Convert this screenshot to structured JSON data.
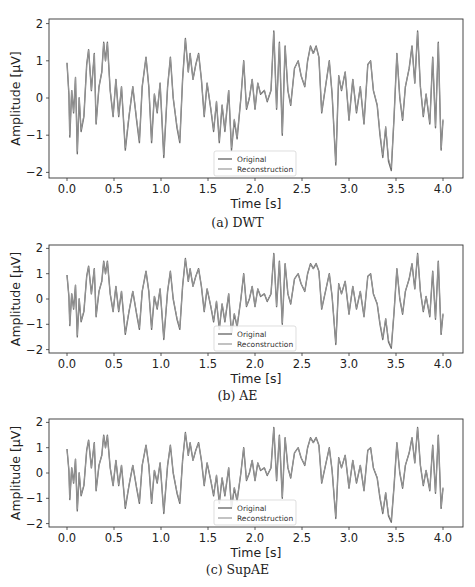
{
  "figure": {
    "panels": [
      {
        "caption": "(a) DWT",
        "ylabel": "Amplitude [µV]",
        "xlabel": "Time [s]",
        "legend": [
          "Original",
          "Reconstruction"
        ]
      },
      {
        "caption": "(b) AE",
        "ylabel": "Amplitude [µV]",
        "xlabel": "Time [s]",
        "legend": [
          "Original",
          "Reconstruction"
        ]
      },
      {
        "caption": "(c) SupAE",
        "ylabel": "Amplitude [µV]",
        "xlabel": "Time [s]",
        "legend": [
          "Original",
          "Reconstruction"
        ]
      }
    ],
    "colors": {
      "original": "#6e6e6e",
      "reconstruction": "#9a9a9a",
      "axes": "#333333"
    }
  },
  "chart_data": [
    {
      "type": "line",
      "title": "(a) DWT",
      "xlabel": "Time [s]",
      "ylabel": "Amplitude [µV]",
      "xlim": [
        -0.1,
        4.1
      ],
      "ylim": [
        -2.1,
        2.1
      ],
      "xticks": [
        "0.0",
        "0.5",
        "1.0",
        "1.5",
        "2.0",
        "2.5",
        "3.0",
        "3.5",
        "4.0"
      ],
      "yticks": [
        "2",
        "1",
        "0",
        "-1",
        "-2"
      ],
      "legend_position": "lower center",
      "grid": false,
      "series": [
        {
          "name": "Original"
        },
        {
          "name": "Reconstruction"
        }
      ]
    },
    {
      "type": "line",
      "title": "(b) AE",
      "xlabel": "Time [s]",
      "ylabel": "Amplitude [µV]",
      "xlim": [
        -0.1,
        4.1
      ],
      "ylim": [
        -2.1,
        2.1
      ],
      "xticks": [
        "0.0",
        "0.5",
        "1.0",
        "1.5",
        "2.0",
        "2.5",
        "3.0",
        "3.5",
        "4.0"
      ],
      "yticks": [
        "2",
        "1",
        "0",
        "-1",
        "-2"
      ],
      "legend_position": "lower center",
      "grid": false,
      "series": [
        {
          "name": "Original"
        },
        {
          "name": "Reconstruction"
        }
      ]
    },
    {
      "type": "line",
      "title": "(c) SupAE",
      "xlabel": "Time [s]",
      "ylabel": "Amplitude [µV]",
      "xlim": [
        -0.1,
        4.1
      ],
      "ylim": [
        -2.1,
        2.1
      ],
      "xticks": [
        "0.0",
        "0.5",
        "1.0",
        "1.5",
        "2.0",
        "2.5",
        "3.0",
        "3.5",
        "4.0"
      ],
      "yticks": [
        "2",
        "1",
        "0",
        "-1",
        "-2"
      ],
      "legend_position": "lower center",
      "grid": false,
      "series": [
        {
          "name": "Original"
        },
        {
          "name": "Reconstruction"
        }
      ]
    }
  ],
  "signal": {
    "t": [
      0.0,
      0.02,
      0.03,
      0.05,
      0.07,
      0.09,
      0.11,
      0.13,
      0.15,
      0.18,
      0.21,
      0.23,
      0.26,
      0.29,
      0.31,
      0.34,
      0.37,
      0.39,
      0.41,
      0.43,
      0.46,
      0.49,
      0.52,
      0.55,
      0.58,
      0.62,
      0.66,
      0.7,
      0.74,
      0.77,
      0.8,
      0.84,
      0.87,
      0.9,
      0.93,
      0.96,
      0.99,
      1.03,
      1.07,
      1.1,
      1.13,
      1.17,
      1.2,
      1.23,
      1.26,
      1.29,
      1.31,
      1.34,
      1.37,
      1.4,
      1.43,
      1.46,
      1.49,
      1.53,
      1.56,
      1.59,
      1.62,
      1.65,
      1.68,
      1.72,
      1.75,
      1.78,
      1.81,
      1.85,
      1.88,
      1.91,
      1.94,
      1.97,
      2.0,
      2.03,
      2.06,
      2.1,
      2.13,
      2.17,
      2.2,
      2.23,
      2.26,
      2.29,
      2.32,
      2.35,
      2.38,
      2.42,
      2.46,
      2.49,
      2.53,
      2.56,
      2.59,
      2.62,
      2.65,
      2.68,
      2.71,
      2.75,
      2.79,
      2.82,
      2.86,
      2.89,
      2.92,
      2.96,
      3.0,
      3.04,
      3.08,
      3.12,
      3.16,
      3.2,
      3.23,
      3.26,
      3.3,
      3.33,
      3.36,
      3.39,
      3.42,
      3.45,
      3.48,
      3.51,
      3.54,
      3.57,
      3.6,
      3.64,
      3.67,
      3.7,
      3.73,
      3.76,
      3.79,
      3.82,
      3.86,
      3.89,
      3.92,
      3.95,
      3.98,
      4.0
    ],
    "v": [
      0.95,
      0.1,
      -1.05,
      0.2,
      -0.4,
      0.55,
      -1.5,
      0.0,
      -0.9,
      -0.5,
      0.9,
      1.3,
      0.2,
      1.2,
      -0.7,
      0.3,
      0.7,
      1.5,
      1.0,
      1.5,
      0.2,
      -0.5,
      0.5,
      -0.5,
      0.3,
      -1.4,
      -0.5,
      0.3,
      -0.6,
      -1.2,
      0.3,
      1.1,
      0.3,
      -1.2,
      0.1,
      -0.4,
      0.4,
      -1.6,
      0.3,
      1.1,
      0.0,
      -0.8,
      -1.2,
      0.5,
      1.6,
      0.7,
      1.2,
      0.5,
      0.9,
      1.2,
      0.5,
      -0.5,
      0.4,
      -0.3,
      -0.9,
      -0.1,
      -1.2,
      -0.2,
      -0.9,
      0.2,
      -1.4,
      -0.6,
      -1.1,
      0.0,
      1.0,
      -0.3,
      0.0,
      0.5,
      -0.3,
      0.4,
      0.1,
      0.2,
      -0.1,
      0.2,
      1.8,
      -0.3,
      1.5,
      -1.0,
      1.4,
      0.2,
      -0.2,
      0.8,
      1.0,
      0.6,
      0.3,
      1.0,
      1.4,
      1.2,
      1.4,
      1.1,
      -0.4,
      0.3,
      1.0,
      0.1,
      -1.8,
      0.6,
      0.2,
      0.7,
      -0.6,
      0.5,
      -0.4,
      0.3,
      -0.7,
      0.9,
      1.0,
      0.2,
      -0.2,
      -1.0,
      -1.6,
      -0.8,
      -1.7,
      -1.95,
      -0.5,
      1.2,
      0.0,
      -0.6,
      0.3,
      0.8,
      1.4,
      0.4,
      1.8,
      0.3,
      -0.5,
      0.1,
      -0.7,
      1.1,
      -0.8,
      1.5,
      -1.4,
      -0.6
    ]
  }
}
